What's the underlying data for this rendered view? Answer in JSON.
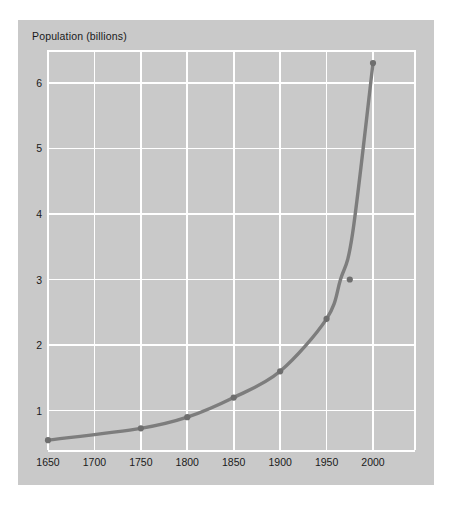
{
  "figure": {
    "panel_bg": "#c9c9c9",
    "page_bg": "#ffffff",
    "grid_color": "#ffffff",
    "line_color": "#7d7d7d",
    "marker_color": "#6e6e6e"
  },
  "chart_data": {
    "type": "line",
    "title": "",
    "subtitle": "",
    "ylabel": "Population (billions)",
    "xlabel": "",
    "xlim": [
      1650,
      2000
    ],
    "ylim": [
      0.4,
      6.5
    ],
    "grid": true,
    "legend": null,
    "x_ticks": [
      1650,
      1700,
      1750,
      1800,
      1850,
      1900,
      1950,
      2000
    ],
    "x_tick_labels": [
      "1650",
      "1700",
      "1750",
      "1800",
      "1850",
      "1900",
      "1950",
      "2000"
    ],
    "y_ticks": [
      1,
      2,
      3,
      4,
      5,
      6
    ],
    "y_tick_labels": [
      "1",
      "2",
      "3",
      "4",
      "5",
      "6"
    ],
    "series": [
      {
        "name": "World population",
        "marker": "circle",
        "x": [
          1650,
          1750,
          1800,
          1850,
          1900,
          1950,
          1975,
          2000
        ],
        "values": [
          0.55,
          0.73,
          0.9,
          1.2,
          1.6,
          2.4,
          3.0,
          6.3
        ]
      }
    ],
    "points": [
      {
        "x": 1650,
        "y": 0.55
      },
      {
        "x": 1750,
        "y": 0.73
      },
      {
        "x": 1800,
        "y": 0.9
      },
      {
        "x": 1850,
        "y": 1.2
      },
      {
        "x": 1900,
        "y": 1.6
      },
      {
        "x": 1950,
        "y": 2.4
      },
      {
        "x": 1965,
        "y": 3.0
      },
      {
        "x": 1978,
        "y": 3.7
      },
      {
        "x": 2000,
        "y": 6.3
      }
    ]
  }
}
